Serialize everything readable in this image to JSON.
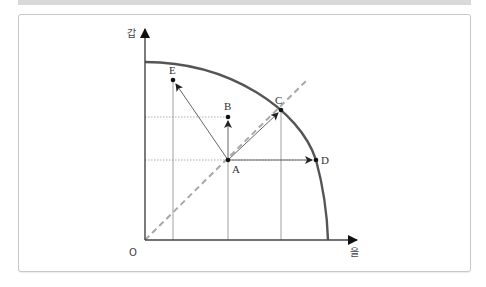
{
  "diagram": {
    "type": "production-possibility-frontier",
    "axes": {
      "y_label": "갑",
      "x_label": "을",
      "origin_label": "O"
    },
    "points": [
      {
        "label": "A",
        "x": 228,
        "y": 160
      },
      {
        "label": "B",
        "x": 228,
        "y": 117
      },
      {
        "label": "C",
        "x": 281,
        "y": 110
      },
      {
        "label": "D",
        "x": 316,
        "y": 160
      },
      {
        "label": "E",
        "x": 173,
        "y": 80
      }
    ],
    "arrows": [
      {
        "from": "A",
        "to": "B"
      },
      {
        "from": "A",
        "to": "C"
      },
      {
        "from": "A",
        "to": "D"
      },
      {
        "from": "A",
        "to": "E"
      }
    ],
    "curve": {
      "description": "concave frontier from y-axis to x-axis",
      "color": "#555555"
    },
    "diagonal": {
      "style": "dashed",
      "color": "#aaaaaa"
    }
  }
}
